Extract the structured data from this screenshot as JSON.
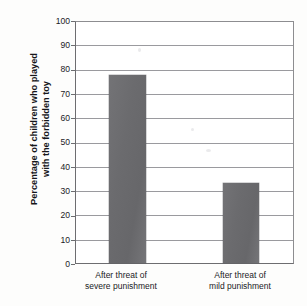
{
  "chart_data": {
    "type": "bar",
    "title": "",
    "xlabel": "",
    "ylabel": "Percentage of children who played with the forbidden toy",
    "ylabel_lines": [
      "Percentage of children who played",
      "with the forbidden toy"
    ],
    "categories": [
      "After threat of severe punishment",
      "After threat of mild punishment"
    ],
    "category_lines": [
      [
        "After threat of",
        "severe punishment"
      ],
      [
        "After threat of",
        "mild punishment"
      ]
    ],
    "values": [
      78,
      33
    ],
    "ylim": [
      0,
      100
    ],
    "ytick_labels": [
      "100",
      "90",
      "80",
      "70",
      "60",
      "50",
      "40",
      "30",
      "20",
      "10",
      "0"
    ],
    "ytick_values": [
      100,
      90,
      80,
      70,
      60,
      50,
      40,
      30,
      20,
      10,
      0
    ],
    "grid": true,
    "legend": "none",
    "bar_color": "#6e6e71",
    "gridline_color": "#9a9a9e",
    "axis_color": "#6d6d70",
    "plot_background": "#ffffff",
    "figure_background": "#fdfdfc",
    "text_color": "#1b1b1f"
  }
}
